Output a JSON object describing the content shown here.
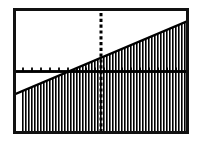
{
  "app": {
    "kind": "graphing-calculator-screen",
    "title": "Graphing Calculator Screen"
  },
  "screen": {
    "bezel_color": "#111111",
    "background_color": "#ffffff",
    "ink_color": "#000000",
    "bezel_width_px": 3,
    "width_px": 176,
    "height_px": 126
  },
  "chart_data": {
    "type": "line",
    "title": "",
    "subtitle": "",
    "xlabel": "",
    "ylabel": "",
    "grid": false,
    "legend": null,
    "legend_position": "none",
    "xlim": [
      -10,
      10
    ],
    "ylim": [
      -10,
      10
    ],
    "xtick_step": 1,
    "ytick_step": 1,
    "axes": {
      "x_axis_visible": true,
      "y_axis_visible": true,
      "x_axis_style": "solid-with-tick-marks",
      "y_axis_style": "dashed-tick-marks",
      "x_axis_y_value": 0,
      "y_axis_x_value": 0
    },
    "series": [
      {
        "name": "boundary-line",
        "type": "line",
        "style": "solid",
        "slope": 0.6,
        "intercept": 2.2,
        "x": [
          -10,
          10
        ],
        "values": [
          -3.8,
          8.2
        ]
      }
    ],
    "shaded_region": {
      "name": "solution-region",
      "description": "vertical hatch fill below the boundary line",
      "relation": "y <= 0.6x + 2.2",
      "fill_style": "vertical-hatch",
      "hatch_spacing_px": 3,
      "hatch_line_width_px": 1.6,
      "hatch_color": "#000000",
      "x_start": -9.4,
      "x_end": 10
    },
    "annotations": []
  },
  "icons": {
    "plot": "line-plot-icon"
  }
}
